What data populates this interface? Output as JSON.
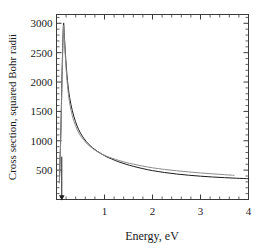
{
  "chart_data": {
    "type": "line",
    "title": "",
    "xlabel": "Energy, eV",
    "ylabel": "Cross section, squared Bohr radii",
    "xlim": [
      0,
      4
    ],
    "ylim": [
      0,
      3150
    ],
    "xticks": [
      1,
      2,
      3,
      4
    ],
    "xtick_labels": [
      "1",
      "2",
      "3",
      "4"
    ],
    "yticks": [
      500,
      1000,
      1500,
      2000,
      2500,
      3000
    ],
    "ytick_labels": [
      "500",
      "1000",
      "1500",
      "2000",
      "2500",
      "3000"
    ],
    "grid": false,
    "legend": null,
    "minor_ticks": true,
    "tick_direction": "in",
    "frame": "box",
    "series": [
      {
        "name": "black-curve",
        "color": "#1a1a1a",
        "linewidth": 1.0,
        "x": [
          0.06,
          0.09,
          0.12,
          0.145,
          0.16,
          0.18,
          0.21,
          0.25,
          0.3,
          0.36,
          0.43,
          0.5,
          0.58,
          0.66,
          0.75,
          0.85,
          0.95,
          1.05,
          1.15,
          1.3,
          1.45,
          1.6,
          1.8,
          2.0,
          2.25,
          2.5,
          2.75,
          3.0,
          3.25,
          3.5,
          3.75,
          4.0
        ],
        "y": [
          300,
          1150,
          2300,
          2980,
          2840,
          2560,
          2200,
          1870,
          1620,
          1420,
          1250,
          1130,
          1030,
          950,
          880,
          820,
          770,
          725,
          690,
          640,
          600,
          565,
          525,
          492,
          460,
          434,
          414,
          397,
          383,
          372,
          362,
          354
        ]
      },
      {
        "name": "gray-curve",
        "color": "#8c8c8c",
        "linewidth": 1.0,
        "x": [
          0.06,
          0.09,
          0.12,
          0.145,
          0.16,
          0.18,
          0.21,
          0.25,
          0.3,
          0.36,
          0.43,
          0.5,
          0.58,
          0.66,
          0.75,
          0.85,
          0.95,
          1.05,
          1.15,
          1.3,
          1.45,
          1.6,
          1.8,
          2.0,
          2.25,
          2.5,
          2.75,
          3.0,
          3.25,
          3.5,
          3.7
        ],
        "y": [
          280,
          1080,
          2180,
          2930,
          2800,
          2500,
          2120,
          1780,
          1530,
          1340,
          1190,
          1085,
          1000,
          930,
          870,
          815,
          772,
          735,
          705,
          665,
          630,
          602,
          568,
          540,
          512,
          490,
          470,
          452,
          437,
          423,
          412
        ]
      }
    ],
    "annotations": [
      {
        "name": "threshold-arrow",
        "type": "arrow",
        "x": 0.11,
        "y_start": 730,
        "y_end": 30,
        "direction": "down",
        "color": "#1a1a1a"
      }
    ]
  },
  "axes": {
    "x_axis_name": "energy-axis",
    "y_axis_name": "cross-section-axis"
  }
}
